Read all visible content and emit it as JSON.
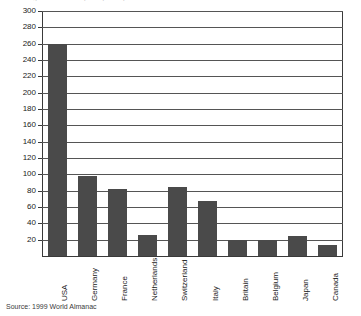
{
  "chart_data": {
    "type": "bar",
    "title": "Cigarette consumption per capita",
    "xlabel": "",
    "ylabel": "",
    "categories": [
      "USA",
      "Germany",
      "France",
      "Netherlands",
      "Switzerland",
      "Italy",
      "Britain",
      "Belgium",
      "Japan",
      "Canada"
    ],
    "values": [
      260,
      98,
      82,
      26,
      84,
      67,
      20,
      20,
      25,
      14
    ],
    "ylim": [
      0,
      300
    ],
    "ytick_step": 20,
    "yticks": [
      20,
      40,
      60,
      80,
      100,
      120,
      140,
      160,
      180,
      200,
      220,
      240,
      260,
      280,
      300
    ],
    "grid": true,
    "legend": "none",
    "bar_color": "#4a4a4a",
    "axis_color": "#3a3a3a",
    "grid_color": "#555555"
  },
  "source": {
    "text": "Source: 1999 World Almanac"
  }
}
